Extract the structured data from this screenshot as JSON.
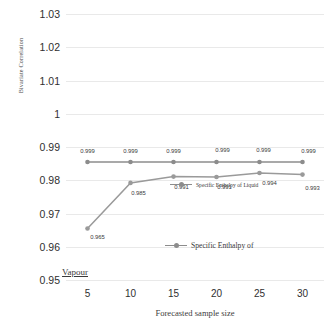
{
  "chart_data": {
    "type": "line",
    "title": "",
    "xlabel": "Forecasted sample size",
    "ylabel": "Bivariate Correlation",
    "categories": [
      5,
      10,
      15,
      20,
      25,
      30
    ],
    "x_ticks": [
      "5",
      "10",
      "15",
      "20",
      "25",
      "30"
    ],
    "y_ticks": [
      "1.03",
      "1.02",
      "1.01",
      "1",
      "0.99",
      "0.98",
      "0.97",
      "0.96",
      "0.95"
    ],
    "ylim": [
      0.95,
      1.03
    ],
    "y_step": 0.01,
    "grid": true,
    "legend_position": "inside-plot",
    "series": [
      {
        "name": "Specific Enthalpy of Liquid",
        "values": [
          0.999,
          0.999,
          0.999,
          0.999,
          0.999,
          0.999
        ],
        "labels": [
          "0.999",
          "0.999",
          "0.999",
          "0.999",
          "0.999",
          "0.999"
        ],
        "color": "#8c8c8c",
        "plot_y": [
          0.9855,
          0.9855,
          0.9855,
          0.9855,
          0.9855,
          0.9855
        ]
      },
      {
        "name": "Specific Enthalpy of Vapour",
        "values": [
          0.965,
          0.985,
          0.991,
          0.991,
          0.994,
          0.993
        ],
        "labels": [
          "0.965",
          "0.985",
          "0.991",
          "0.991",
          "0.994",
          "0.993"
        ],
        "color": "#9a9a9a",
        "plot_y": [
          0.9655,
          0.9792,
          0.9811,
          0.981,
          0.9822,
          0.9817
        ]
      }
    ]
  },
  "legend": {
    "items": [
      {
        "label": "Specific Enthalpy of Liquid",
        "key": "legend-marker"
      },
      {
        "label": "Specific Enthalpy of",
        "key": "legend-marker"
      }
    ],
    "wrapped_label": "Vapour"
  },
  "colors": {
    "series_liquid": "#8c8c8c",
    "series_vapour": "#9a9a9a",
    "gridline": "#e9e9e9",
    "text": "#3a3a3a",
    "background": "#ffffff"
  }
}
